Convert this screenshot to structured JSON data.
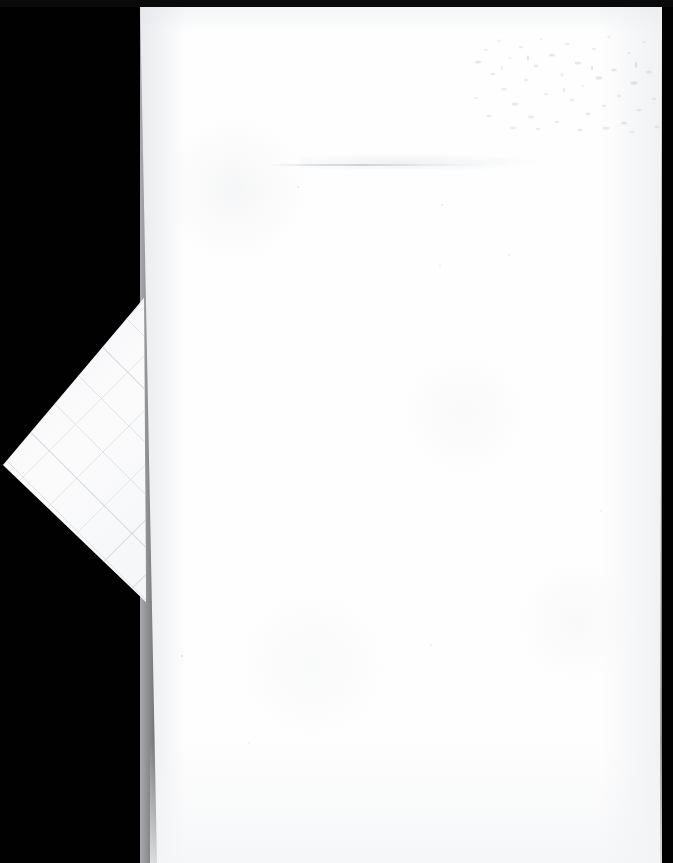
{
  "document": {
    "title": "Scanned blank sheet",
    "page_text": "",
    "visible_text": "",
    "background_color": "#010101",
    "paper_color": "#fefefe",
    "width_px": 673,
    "height_px": 863
  },
  "scan": {
    "background_label": "scanner-backing-black",
    "paper_label": "blank-paper-sheet",
    "edges": {
      "left_top_x": 140,
      "left_bottom_x": 157,
      "right_top_x": 662,
      "right_bottom_x": 660,
      "top_y": 0,
      "bottom_y": 863
    }
  },
  "artifacts": {
    "fold": {
      "label": "folded-corner-flap",
      "shape": "triangle",
      "apex_x": 3,
      "apex_y": 465,
      "top_x": 144,
      "top_y": 298,
      "bottom_x": 146,
      "bottom_y": 602,
      "texture": "faint-diagonal-crease-grid"
    },
    "crease": {
      "label": "horizontal-crease",
      "x": 268,
      "y": 164,
      "width": 215,
      "color": "#c1c6cb"
    },
    "foxing": {
      "label": "foxing-speckle-stain",
      "x": 468,
      "y": 28,
      "width": 192,
      "height": 108,
      "color": "#b9bcc2",
      "description": "faint mottled speckles / age spots"
    },
    "top_band": {
      "label": "scanner-top-edge-band",
      "height": 7,
      "color": "#0a0a0a"
    }
  },
  "specks": [
    {
      "x": 181,
      "y": 655,
      "size": 2,
      "opacity": 0.3
    },
    {
      "x": 297,
      "y": 186,
      "size": 2,
      "opacity": 0.22
    },
    {
      "x": 441,
      "y": 204,
      "size": 2,
      "opacity": 0.2
    },
    {
      "x": 508,
      "y": 254,
      "size": 2,
      "opacity": 0.18
    },
    {
      "x": 439,
      "y": 265,
      "size": 2,
      "opacity": 0.16
    },
    {
      "x": 430,
      "y": 644,
      "size": 2,
      "opacity": 0.16
    },
    {
      "x": 600,
      "y": 510,
      "size": 2,
      "opacity": 0.14
    },
    {
      "x": 248,
      "y": 742,
      "size": 2,
      "opacity": 0.14
    }
  ]
}
